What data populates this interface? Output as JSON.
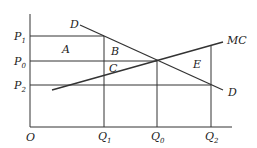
{
  "diagram": {
    "axes": {
      "origin": "O"
    },
    "prices": [
      {
        "label": "P",
        "sub": "1",
        "y": 36
      },
      {
        "label": "P",
        "sub": "0",
        "y": 61
      },
      {
        "label": "P",
        "sub": "2",
        "y": 85
      }
    ],
    "quantities": [
      {
        "label": "Q",
        "sub": "1",
        "x": 104
      },
      {
        "label": "Q",
        "sub": "0",
        "x": 157
      },
      {
        "label": "Q",
        "sub": "2",
        "x": 211
      }
    ],
    "curves": {
      "demand_top": "D",
      "demand_bottom": "D",
      "marginal_cost": "MC"
    },
    "areas": [
      "A",
      "B",
      "C",
      "E"
    ]
  }
}
